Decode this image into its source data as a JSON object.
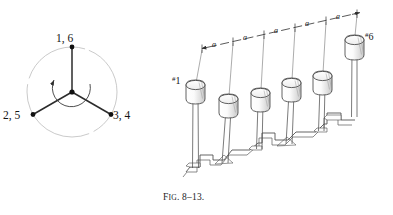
{
  "figure": {
    "caption_prefix": "F",
    "caption_prefix_rest": "IG",
    "caption_number": ". 8–13.",
    "caption_full": "Fig. 8–13."
  },
  "phasor_diagram": {
    "name": "three-phase-star-phasor-diagram",
    "center": {
      "x": 72,
      "y": 92
    },
    "circle_radius": 45,
    "rotation_direction": "counterclockwise",
    "spokes": [
      {
        "id": "spoke-1-6",
        "label": "1, 6",
        "angle_deg": 90,
        "label_x": 56,
        "label_y": 36
      },
      {
        "id": "spoke-2-5",
        "label": "2, 5",
        "angle_deg": 210,
        "label_x": 4,
        "label_y": 112
      },
      {
        "id": "spoke-3-4",
        "label": "3, 4",
        "angle_deg": 330,
        "label_x": 110,
        "label_y": 112
      }
    ],
    "colors": {
      "circle": "#b9b9b9",
      "spoke": "#2b2b2b",
      "node": "#111111",
      "arrow": "#333333"
    }
  },
  "perspective_diagram": {
    "name": "six-mass-pole-array-perspective",
    "mass_count": 6,
    "masses": [
      {
        "id": "mass-1",
        "label": "#1",
        "label_hash": "#",
        "label_number": "1",
        "label_x": 176,
        "label_y": 80
      },
      {
        "id": "mass-2",
        "label": "",
        "label_hash": "",
        "label_number": "",
        "label_x": 0,
        "label_y": 0
      },
      {
        "id": "mass-3",
        "label": "",
        "label_hash": "",
        "label_number": "",
        "label_x": 0,
        "label_y": 0
      },
      {
        "id": "mass-4",
        "label": "",
        "label_hash": "",
        "label_number": "",
        "label_x": 0,
        "label_y": 0
      },
      {
        "id": "mass-5",
        "label": "",
        "label_hash": "",
        "label_number": "",
        "label_x": 0,
        "label_y": 0
      },
      {
        "id": "mass-6",
        "label": "#6",
        "label_hash": "#",
        "label_number": "6",
        "label_x": 361,
        "label_y": 35
      }
    ],
    "dimension_line": {
      "name": "spacing-dimension-line",
      "segment_label": "a",
      "segment_count": 5,
      "labels": [
        {
          "text": "a",
          "x": 212,
          "y": 43
        },
        {
          "text": "a",
          "x": 244,
          "y": 36
        },
        {
          "text": "a",
          "x": 276,
          "y": 29
        },
        {
          "text": "a",
          "x": 305,
          "y": 22
        },
        {
          "text": "a",
          "x": 336,
          "y": 15
        }
      ]
    },
    "colors": {
      "outline": "#3a3a3a",
      "shading": "#8e8e8e",
      "ground": "#4a4a4a"
    }
  }
}
